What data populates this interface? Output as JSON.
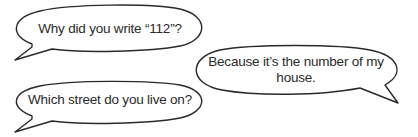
{
  "bubbles": [
    {
      "id": "bubble-1",
      "speaker_side": "left",
      "text": "Why did you write “112”?"
    },
    {
      "id": "bubble-2",
      "speaker_side": "right",
      "text": "Because it’s the number of my house."
    },
    {
      "id": "bubble-3",
      "speaker_side": "left",
      "text": "Which street do you live on?"
    }
  ],
  "colors": {
    "outline": "#2a2a2a",
    "text": "#2a2a2a",
    "background": "#ffffff"
  }
}
